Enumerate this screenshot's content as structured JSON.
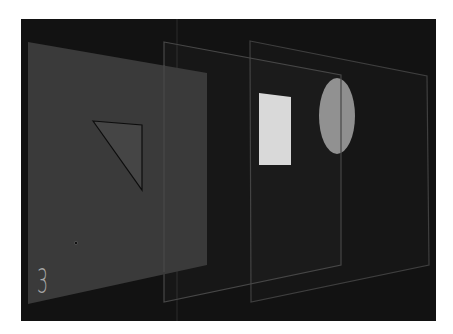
{
  "diagram": {
    "layer_number_label": "3",
    "colors": {
      "page_background": "#ffffff",
      "stage_background": "#121212",
      "layer1_fill": "#3b3b3b",
      "layer_stroke": "#4c4c4c",
      "triangle_fill": "#444444",
      "triangle_stroke": "#0d0d0d",
      "rectangle_fill": "#d9d9d9",
      "ellipse_fill": "#8f8f8f",
      "label_color": "#a8a8a8"
    },
    "layers": [
      {
        "name": "layer-front",
        "shape": "triangle",
        "points": "28,42 207,73 207,265 28,304"
      },
      {
        "name": "layer-middle",
        "shape": "rectangle",
        "points": "164,42 341,75 341,265 164,302"
      },
      {
        "name": "layer-back",
        "shape": "ellipse",
        "points": "250,41 427,76 429,265 251,302"
      }
    ],
    "shapes": {
      "triangle_points": "93,121 142,125 142,190",
      "rectangle_points": "259,93 291,97 291,165 259,165",
      "ellipse": {
        "cx": 337,
        "cy": 116,
        "rx": 18,
        "ry": 38
      }
    }
  }
}
